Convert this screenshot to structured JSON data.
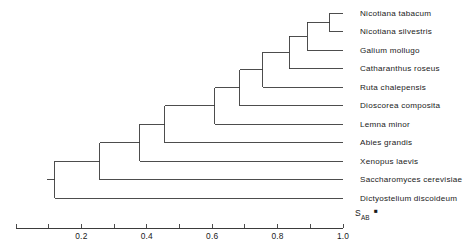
{
  "figure": {
    "type": "dendrogram",
    "title": "",
    "width": 471,
    "height": 251
  },
  "taxa": [
    {
      "label": "Nicotiana tabacum"
    },
    {
      "label": "Nicotiana silvestris"
    },
    {
      "label": "Galium mollugo"
    },
    {
      "label": "Catharanthus roseus"
    },
    {
      "label": "Ruta  chalepensis"
    },
    {
      "label": "Dioscorea composita"
    },
    {
      "label": "Lemna minor"
    },
    {
      "label": "Abies grandis"
    },
    {
      "label": "Xenopus  laevis"
    },
    {
      "label": "Saccharomyces  cerevisiae"
    },
    {
      "label": "Dictyostelium  discoideum"
    }
  ],
  "axis": {
    "symbol_main": "S",
    "symbol_sub": "AB",
    "marker": "■",
    "min": 0.0,
    "max": 1.0,
    "tick_values": [
      0.0,
      0.1,
      0.2,
      0.3,
      0.4,
      0.5,
      0.6,
      0.7,
      0.8,
      0.9,
      1.0
    ],
    "labeled_ticks": [
      {
        "value": 0.2,
        "label": "0.2"
      },
      {
        "value": 0.4,
        "label": "0.4"
      },
      {
        "value": 0.6,
        "label": "0.6"
      },
      {
        "value": 0.8,
        "label": "0.8"
      },
      {
        "value": 1.0,
        "label": "1.0"
      }
    ]
  },
  "chart_data": {
    "type": "line",
    "title": "",
    "xlabel": "S_AB",
    "ylabel": "",
    "xlim": [
      0.0,
      1.0
    ],
    "grid": false,
    "legend": "none",
    "categories": [
      "Nicotiana tabacum",
      "Nicotiana silvestris",
      "Galium mollugo",
      "Catharanthus roseus",
      "Ruta  chalepensis",
      "Dioscorea composita",
      "Lemna minor",
      "Abies grandis",
      "Xenopus  laevis",
      "Saccharomyces  cerevisiae",
      "Dictyostelium  discoideum"
    ],
    "tip_similarity": 1.0,
    "nodes": [
      {
        "name": "node-nicotiana",
        "similarity": 0.96,
        "children": [
          "Nicotiana tabacum",
          "Nicotiana silvestris"
        ]
      },
      {
        "name": "node-galium",
        "similarity": 0.89,
        "children": [
          "node-nicotiana",
          "Galium mollugo"
        ]
      },
      {
        "name": "node-catharanthus",
        "similarity": 0.835,
        "children": [
          "node-galium",
          "Catharanthus roseus"
        ]
      },
      {
        "name": "node-ruta",
        "similarity": 0.755,
        "children": [
          "node-catharanthus",
          "Ruta  chalepensis"
        ]
      },
      {
        "name": "node-dioscorea",
        "similarity": 0.685,
        "children": [
          "node-ruta",
          "Dioscorea composita"
        ]
      },
      {
        "name": "node-lemna",
        "similarity": 0.608,
        "children": [
          "node-dioscorea",
          "Lemna minor"
        ]
      },
      {
        "name": "node-abies",
        "similarity": 0.455,
        "children": [
          "node-lemna",
          "Abies grandis"
        ]
      },
      {
        "name": "node-xenopus",
        "similarity": 0.378,
        "children": [
          "node-abies",
          "Xenopus  laevis"
        ]
      },
      {
        "name": "node-saccharomyces",
        "similarity": 0.256,
        "children": [
          "node-xenopus",
          "Saccharomyces  cerevisiae"
        ]
      },
      {
        "name": "node-root",
        "similarity": 0.119,
        "children": [
          "node-saccharomyces",
          "Dictyostelium  discoideum"
        ]
      }
    ]
  }
}
